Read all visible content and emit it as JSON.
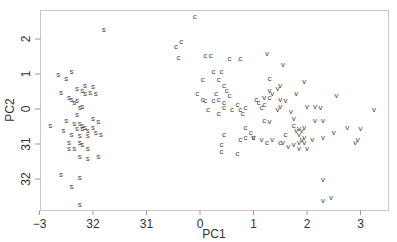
{
  "chart_data": {
    "type": "scatter",
    "title": "",
    "xlabel": "PC1",
    "ylabel": "PC2",
    "xlim": [
      -3.0,
      3.5
    ],
    "ylim": [
      -2.9,
      2.85
    ],
    "grid": false,
    "legend": "none (points drawn as letter glyphs)",
    "x_ticks": [
      -3,
      -2,
      -1,
      0,
      1,
      2,
      3
    ],
    "x_tick_labels": [
      "−3",
      "32",
      "31",
      "0",
      "1",
      "2",
      "3"
    ],
    "y_ticks": [
      -2,
      -1,
      0,
      1,
      2
    ],
    "y_tick_labels": [
      "32",
      "31",
      "0",
      "1",
      "2"
    ],
    "series": [
      {
        "name": "s",
        "glyph": "s",
        "points": [
          [
            -1.8,
            2.3
          ],
          [
            -2.65,
            1.0
          ],
          [
            -2.5,
            0.9
          ],
          [
            -2.4,
            1.1
          ],
          [
            -2.6,
            0.5
          ],
          [
            -2.45,
            0.35
          ],
          [
            -2.3,
            0.6
          ],
          [
            -2.15,
            0.7
          ],
          [
            -2.05,
            0.5
          ],
          [
            -2.0,
            0.65
          ],
          [
            -1.95,
            0.45
          ],
          [
            -2.2,
            0.55
          ],
          [
            -2.4,
            0.3
          ],
          [
            -2.35,
            0.2
          ],
          [
            -2.25,
            0.05
          ],
          [
            -2.5,
            -0.3
          ],
          [
            -2.35,
            -0.4
          ],
          [
            -2.25,
            -0.4
          ],
          [
            -2.2,
            -0.55
          ],
          [
            -2.15,
            -0.5
          ],
          [
            -2.1,
            -0.6
          ],
          [
            -2.0,
            -0.5
          ],
          [
            -1.9,
            -0.35
          ],
          [
            -2.8,
            -0.45
          ],
          [
            -2.55,
            -0.6
          ],
          [
            -2.4,
            -0.7
          ],
          [
            -2.25,
            -0.75
          ],
          [
            -2.1,
            -0.75
          ],
          [
            -1.95,
            -0.65
          ],
          [
            -1.85,
            -0.7
          ],
          [
            -2.45,
            -1.1
          ],
          [
            -2.35,
            -1.1
          ],
          [
            -2.25,
            -0.95
          ],
          [
            -2.2,
            -1.0
          ],
          [
            -2.1,
            -1.1
          ],
          [
            -2.25,
            -1.35
          ],
          [
            -2.1,
            -1.4
          ],
          [
            -1.9,
            -1.35
          ],
          [
            -2.6,
            -1.85
          ],
          [
            -2.25,
            -1.95
          ],
          [
            -2.4,
            -2.2
          ],
          [
            -2.25,
            -2.7
          ],
          [
            -2.3,
            -0.55
          ],
          [
            -2.2,
            -0.45
          ],
          [
            -2.3,
            0.25
          ],
          [
            -2.15,
            0.45
          ],
          [
            -2.3,
            -0.15
          ],
          [
            -2.0,
            -0.25
          ],
          [
            -2.45,
            -0.95
          ],
          [
            -2.2,
            0.1
          ]
        ]
      },
      {
        "name": "c",
        "glyph": "c",
        "points": [
          [
            -0.1,
            2.65
          ],
          [
            -0.45,
            1.8
          ],
          [
            -0.35,
            1.95
          ],
          [
            -0.4,
            1.5
          ],
          [
            0.1,
            1.55
          ],
          [
            0.2,
            1.55
          ],
          [
            0.55,
            1.45
          ],
          [
            0.75,
            1.45
          ],
          [
            0.25,
            1.1
          ],
          [
            0.4,
            1.1
          ],
          [
            0.05,
            0.85
          ],
          [
            0.35,
            0.85
          ],
          [
            0.45,
            0.7
          ],
          [
            0.5,
            0.55
          ],
          [
            0.3,
            0.45
          ],
          [
            0.55,
            0.4
          ],
          [
            0.35,
            0.3
          ],
          [
            0.45,
            0.2
          ],
          [
            -0.05,
            0.45
          ],
          [
            0.1,
            0.25
          ],
          [
            0.25,
            0.25
          ],
          [
            0.45,
            0.05
          ],
          [
            0.6,
            0.0
          ],
          [
            0.7,
            0.15
          ],
          [
            0.75,
            0.0
          ],
          [
            0.8,
            -0.1
          ],
          [
            0.85,
            0.05
          ],
          [
            0.05,
            0.3
          ],
          [
            0.15,
            0.0
          ],
          [
            0.35,
            -0.1
          ],
          [
            1.3,
            0.9
          ],
          [
            1.1,
            0.2
          ],
          [
            1.05,
            0.3
          ],
          [
            1.2,
            0.15
          ],
          [
            1.3,
            0.35
          ],
          [
            1.2,
            -0.3
          ],
          [
            0.85,
            -0.5
          ],
          [
            0.95,
            -0.65
          ],
          [
            0.75,
            -0.85
          ],
          [
            0.85,
            -0.8
          ],
          [
            1.0,
            -0.8
          ],
          [
            1.25,
            -0.95
          ],
          [
            0.45,
            -0.7
          ],
          [
            0.4,
            -1.0
          ],
          [
            0.4,
            -1.2
          ],
          [
            0.7,
            -1.25
          ],
          [
            1.5,
            -0.95
          ],
          [
            1.75,
            -0.45
          ],
          [
            1.6,
            -0.7
          ],
          [
            1.15,
            0.05
          ]
        ]
      },
      {
        "name": "v",
        "glyph": "v",
        "points": [
          [
            1.25,
            1.6
          ],
          [
            1.55,
            1.3
          ],
          [
            1.95,
            0.8
          ],
          [
            1.5,
            0.7
          ],
          [
            1.45,
            0.6
          ],
          [
            1.3,
            0.55
          ],
          [
            1.35,
            0.45
          ],
          [
            1.2,
            0.35
          ],
          [
            1.5,
            0.3
          ],
          [
            1.6,
            0.25
          ],
          [
            1.8,
            0.45
          ],
          [
            2.55,
            0.4
          ],
          [
            2.0,
            0.1
          ],
          [
            2.15,
            0.1
          ],
          [
            2.25,
            0.05
          ],
          [
            1.5,
            0.1
          ],
          [
            1.45,
            0.0
          ],
          [
            1.7,
            -0.05
          ],
          [
            2.15,
            -0.3
          ],
          [
            2.3,
            -0.3
          ],
          [
            1.75,
            -0.25
          ],
          [
            1.3,
            -0.35
          ],
          [
            1.85,
            -0.55
          ],
          [
            1.9,
            -0.6
          ],
          [
            1.95,
            -0.5
          ],
          [
            1.8,
            -0.6
          ],
          [
            1.85,
            -0.7
          ],
          [
            1.9,
            -0.85
          ],
          [
            1.95,
            -0.95
          ],
          [
            2.1,
            -0.85
          ],
          [
            2.3,
            -0.8
          ],
          [
            2.5,
            -0.65
          ],
          [
            2.75,
            -0.5
          ],
          [
            3.25,
            0.0
          ],
          [
            3.0,
            -0.55
          ],
          [
            2.95,
            -0.85
          ],
          [
            2.9,
            -0.95
          ],
          [
            1.35,
            -0.85
          ],
          [
            1.55,
            -0.95
          ],
          [
            1.65,
            -1.05
          ],
          [
            1.75,
            -1.0
          ],
          [
            1.85,
            -0.95
          ],
          [
            1.85,
            -1.1
          ],
          [
            2.0,
            -1.1
          ],
          [
            2.3,
            -2.0
          ],
          [
            2.3,
            -2.6
          ],
          [
            2.45,
            -2.5
          ],
          [
            1.0,
            -0.8
          ],
          [
            1.15,
            -0.85
          ],
          [
            1.95,
            -0.8
          ]
        ]
      }
    ]
  }
}
